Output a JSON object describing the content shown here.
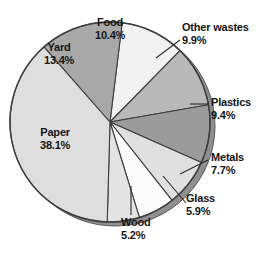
{
  "chart_data": {
    "type": "pie",
    "title": "",
    "subtitle": "",
    "xlabel": "",
    "ylabel": "",
    "units": "percent",
    "total": 100.0,
    "legend_position": "none",
    "grid": false,
    "label_format": "name + percent",
    "categories": [
      "Food",
      "Other wastes",
      "Plastics",
      "Metals",
      "Glass",
      "Wood",
      "Paper",
      "Yard"
    ],
    "values": [
      10.4,
      9.9,
      9.4,
      7.7,
      5.9,
      5.2,
      38.1,
      13.4
    ],
    "slices": [
      {
        "name": "Food",
        "value": 10.4,
        "label": "Food",
        "percent_text": "10.4%",
        "color": "#f2f2f2",
        "label_placement": "inside",
        "leader_line": false
      },
      {
        "name": "Other wastes",
        "value": 9.9,
        "label": "Other wastes",
        "percent_text": "9.9%",
        "color": "#b9b9b9",
        "label_placement": "outside",
        "leader_line": true
      },
      {
        "name": "Plastics",
        "value": 9.4,
        "label": "Plastics",
        "percent_text": "9.4%",
        "color": "#9b9b9b",
        "label_placement": "outside",
        "leader_line": true
      },
      {
        "name": "Metals",
        "value": 7.7,
        "label": "Metals",
        "percent_text": "7.7%",
        "color": "#e0e0e0",
        "label_placement": "outside",
        "leader_line": true
      },
      {
        "name": "Glass",
        "value": 5.9,
        "label": "Glass",
        "percent_text": "5.9%",
        "color": "#fbfbfb",
        "label_placement": "outside",
        "leader_line": true
      },
      {
        "name": "Wood",
        "value": 5.2,
        "label": "Wood",
        "percent_text": "5.2%",
        "color": "#e3e3e3",
        "label_placement": "outside",
        "leader_line": true
      },
      {
        "name": "Paper",
        "value": 38.1,
        "label": "Paper",
        "percent_text": "38.1%",
        "color": "#dedede",
        "label_placement": "inside",
        "leader_line": false
      },
      {
        "name": "Yard",
        "value": 13.4,
        "label": "Yard",
        "percent_text": "13.4%",
        "color": "#a8a8a8",
        "label_placement": "inside",
        "leader_line": false
      }
    ],
    "style": {
      "background": "#ffffff",
      "outline_color": "#3d3d3d",
      "shadow_color": "#8f8f8f",
      "text_color": "#141414"
    }
  }
}
